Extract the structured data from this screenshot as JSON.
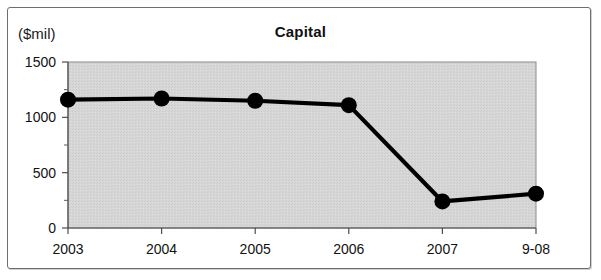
{
  "figure": {
    "unit_label": "($mil)",
    "title": "Capital"
  },
  "chart_data": {
    "type": "line",
    "title": "Capital",
    "subtitle": "",
    "xlabel": "",
    "ylabel": "($mil)",
    "categories": [
      "2003",
      "2004",
      "2005",
      "2006",
      "2007",
      "9-08"
    ],
    "values": [
      1160,
      1170,
      1150,
      1110,
      240,
      310
    ],
    "series": [
      {
        "name": "Capital",
        "values": [
          1160,
          1170,
          1150,
          1110,
          240,
          310
        ]
      }
    ],
    "ylim": [
      0,
      1500
    ],
    "ytick_labels": [
      "0",
      "500",
      "1000",
      "1500"
    ],
    "ytick_values": [
      0,
      500,
      1000,
      1500
    ],
    "yminor_values": [
      250,
      750,
      1250
    ],
    "xtick_labels": [
      "2003",
      "2004",
      "2005",
      "2006",
      "2007",
      "9-08"
    ],
    "grid": false,
    "legend": "none",
    "plot_background": "#d4d4d4",
    "line_color": "#000000",
    "marker_color": "#000000",
    "marker_shape": "circle"
  }
}
